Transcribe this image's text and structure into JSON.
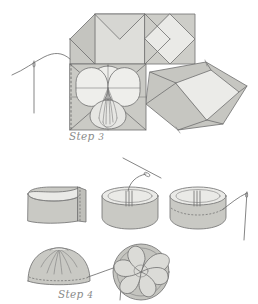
{
  "document": {
    "kind": "craft-instruction-diagram",
    "title": "Fabric flower folding and gathering steps"
  },
  "captions": {
    "step3": {
      "word": "Step",
      "number": "3"
    },
    "step4": {
      "word": "Step",
      "number": "4"
    }
  },
  "palette": {
    "paper_white": "#ffffff",
    "fill_light": "#e8e8e6",
    "fill_mid": "#cfcfcb",
    "fill_dark": "#b9b9b4",
    "fill_deep": "#a9a9a4",
    "outline": "#6f6f6f",
    "outline_soft": "#8d8d8d",
    "caption_gray": "#8a8a8a",
    "thread_gray": "#7a7a7a"
  },
  "step3": {
    "label": "Step 3",
    "description": "Folded square of fabric with petal flaps turned back, needle and thread entering at left",
    "elements": [
      {
        "name": "upper-left-folded-square",
        "fill": "#cfcfcb"
      },
      {
        "name": "upper-right-rotated-square",
        "fill": "#e8e8e6"
      },
      {
        "name": "central-square-panel",
        "fill": "#cfcfcb"
      },
      {
        "name": "petal-top",
        "fill": "#e4e4e1"
      },
      {
        "name": "petal-left",
        "fill": "#e4e4e1"
      },
      {
        "name": "petal-right",
        "fill": "#e4e4e1"
      },
      {
        "name": "petal-bottom",
        "fill": "#e4e4e1"
      },
      {
        "name": "gathered-center-tuft",
        "fill": "#dcdcd8"
      },
      {
        "name": "lower-right-rotated-square",
        "fill": "#e8e8e6"
      },
      {
        "name": "needle-and-thread",
        "fill": "#7a7a7a"
      }
    ]
  },
  "step4": {
    "label": "Step 4",
    "description": "Strip of fabric joined into a ring, running stitch gathered, then pulled closed into a rosette",
    "stages": [
      {
        "index": 1,
        "name": "fabric-strip-overlap",
        "caption_hint": "strip with seam allowance overlapped"
      },
      {
        "index": 2,
        "name": "ring-seam-stitched",
        "caption_hint": "ring with seam stitched, needle above"
      },
      {
        "index": 3,
        "name": "ring-running-stitch",
        "caption_hint": "running stitch along lower edge, needle at right"
      },
      {
        "index": 4,
        "name": "gathered-dome",
        "caption_hint": "thread drawn up into a gathered dome"
      },
      {
        "index": 5,
        "name": "finished-rosette",
        "caption_hint": "finished swirled rosette seen from above"
      }
    ]
  }
}
